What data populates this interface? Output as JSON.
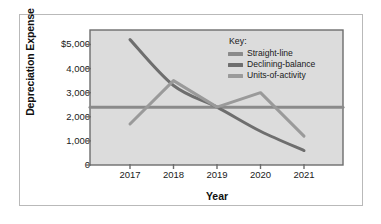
{
  "chart_data": {
    "type": "line",
    "title": "",
    "xlabel": "Year",
    "ylabel": "Depreciation Expense",
    "categories": [
      "2017",
      "2018",
      "2019",
      "2020",
      "2021"
    ],
    "x_tick_labels": [
      "2017",
      "2018",
      "2019",
      "2020",
      "2021"
    ],
    "y_tick_labels": [
      "$5,000",
      "4,000",
      "3,000",
      "2,000",
      "1,000",
      "0"
    ],
    "y_tick_values": [
      5000,
      4000,
      3000,
      2000,
      1000,
      0
    ],
    "ylim": [
      0,
      5600
    ],
    "grid": false,
    "legend_position": "top-right",
    "legend_title": "Key:",
    "series": [
      {
        "name": "Straight-line",
        "values": [
          2400,
          2400,
          2400,
          2400,
          2400
        ],
        "color": "#8a8a8a"
      },
      {
        "name": "Declining-balance",
        "values": [
          5200,
          3300,
          2400,
          1400,
          600
        ],
        "color": "#6e6e6e"
      },
      {
        "name": "Units-of-activity",
        "values": [
          1700,
          3500,
          2400,
          3000,
          1200
        ],
        "color": "#9a9a9a"
      }
    ]
  },
  "axes": {
    "y_title": "Depreciation Expense",
    "x_title": "Year"
  },
  "legend": {
    "title": "Key:",
    "items": [
      {
        "label": "Straight-line"
      },
      {
        "label": "Declining-balance"
      },
      {
        "label": "Units-of-activity"
      }
    ]
  },
  "colors": {
    "plot_background": "#dcdcdc",
    "plot_border": "#6d6d6d",
    "card_border": "#b9b9b9",
    "straight_line": "#8a8a8a",
    "declining_balance": "#6e6e6e",
    "units_of_activity": "#9a9a9a",
    "text": "#1a1a1a"
  }
}
